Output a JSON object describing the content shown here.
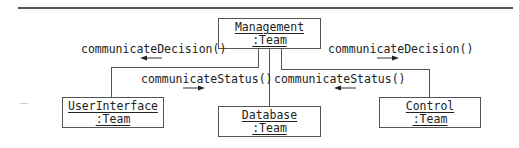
{
  "diagram": {
    "type": "UML communication diagram",
    "objects": {
      "management": {
        "name": "Management",
        "class": ":Team"
      },
      "user_interface": {
        "name": "UserInterface",
        "class": ":Team"
      },
      "database": {
        "name": "Database",
        "class": ":Team"
      },
      "control": {
        "name": "Control",
        "class": ":Team"
      }
    },
    "messages": {
      "decision_left": {
        "label": "communicateDecision()",
        "direction": "left"
      },
      "decision_right": {
        "label": "communicateDecision()",
        "direction": "right"
      },
      "status_left": {
        "label": "communicateStatus()",
        "direction": "right"
      },
      "status_right": {
        "label": "communicateStatus()",
        "direction": "left"
      }
    },
    "colors": {
      "line": "#555555",
      "text": "#222222",
      "background": "#ffffff"
    }
  }
}
